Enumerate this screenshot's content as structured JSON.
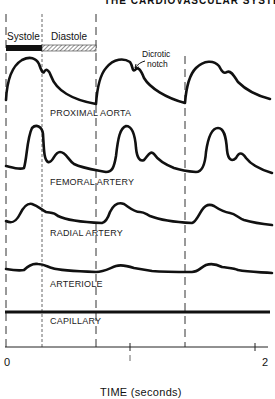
{
  "header": {
    "title": "THE CARDIOVASCULAR SYSTEM"
  },
  "phases": {
    "systole": "Systole",
    "diastole": "Diastole",
    "systole_color": "#111111",
    "diastole_pattern": "hatched"
  },
  "annotation": {
    "line1": "Dicrotic",
    "line2": "notch"
  },
  "traces": [
    {
      "id": "proximal-aorta",
      "label": "PROXIMAL AORTA"
    },
    {
      "id": "femoral-artery",
      "label": "FEMORAL ARTERY"
    },
    {
      "id": "radial-artery",
      "label": "RADIAL ARTERY"
    },
    {
      "id": "arteriole",
      "label": "ARTERIOLE"
    },
    {
      "id": "capillary",
      "label": "CAPILLARY"
    }
  ],
  "axis": {
    "tick_start": "0",
    "tick_end": "2",
    "label": "TIME (seconds)"
  }
}
